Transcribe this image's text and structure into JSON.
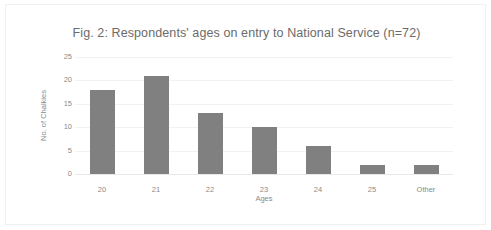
{
  "figure": {
    "frame_color": "#f0f0f0",
    "background": "#ffffff"
  },
  "chart_data": {
    "type": "bar",
    "title": "Fig. 2: Respondents' ages on entry to National Service (n=72)",
    "xlabel": "Ages",
    "ylabel": "No. of Chalkies",
    "categories": [
      "20",
      "21",
      "22",
      "23",
      "24",
      "25",
      "Other"
    ],
    "values": [
      18,
      21,
      13,
      10,
      6,
      2,
      2
    ],
    "ylim": [
      0,
      25
    ],
    "yticks": [
      0,
      5,
      10,
      15,
      20,
      25
    ],
    "ytick_labels": [
      "0",
      "5",
      "10",
      "15",
      "20",
      "25"
    ],
    "grid": true,
    "grid_axis": "y",
    "legend": false,
    "bar_color": "#808080",
    "grid_color": "#f2f2f2",
    "text_color": "#8a8a8a",
    "title_color": "#6b6b6b",
    "total": 72
  }
}
